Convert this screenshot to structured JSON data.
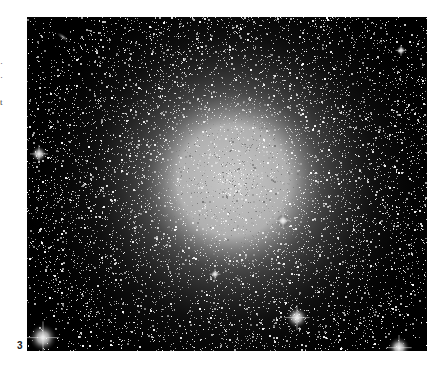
{
  "page": {
    "text_fragments": [
      {
        "text": "·",
        "top": 58
      },
      {
        "text": "·",
        "top": 72
      },
      {
        "text": "t",
        "top": 97
      }
    ],
    "figure_label": "3"
  },
  "image": {
    "subject": "globular star cluster",
    "background_color": "#000000",
    "core": {
      "cx": 0.515,
      "cy": 0.49,
      "radius": 0.15,
      "halo_radius": 0.55,
      "core_color": "#c8c8c8"
    },
    "star_count": 9000,
    "bright_stars": [
      {
        "x": 0.04,
        "y": 0.96,
        "r": 9
      },
      {
        "x": 0.675,
        "y": 0.9,
        "r": 7
      },
      {
        "x": 0.03,
        "y": 0.41,
        "r": 5
      },
      {
        "x": 0.64,
        "y": 0.61,
        "r": 4
      },
      {
        "x": 0.93,
        "y": 0.99,
        "r": 7
      },
      {
        "x": 0.935,
        "y": 0.1,
        "r": 3
      },
      {
        "x": 0.47,
        "y": 0.77,
        "r": 3
      }
    ],
    "small_galaxy": {
      "x": 0.09,
      "y": 0.06,
      "angle": 35
    }
  }
}
